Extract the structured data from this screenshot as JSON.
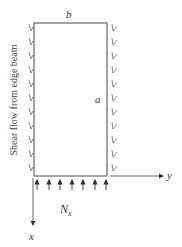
{
  "diagram": {
    "labels": {
      "width": "b",
      "height": "a",
      "load": "N",
      "load_sub": "x",
      "axis_y": "y",
      "axis_x": "x",
      "side_note": "Shear flow from edge beam"
    },
    "colors": {
      "line": "#555555",
      "text": "#333333",
      "background": "#ffffff"
    },
    "counts": {
      "left_shear_arrows": 11,
      "right_shear_arrows": 11,
      "load_arrows": 7
    }
  }
}
